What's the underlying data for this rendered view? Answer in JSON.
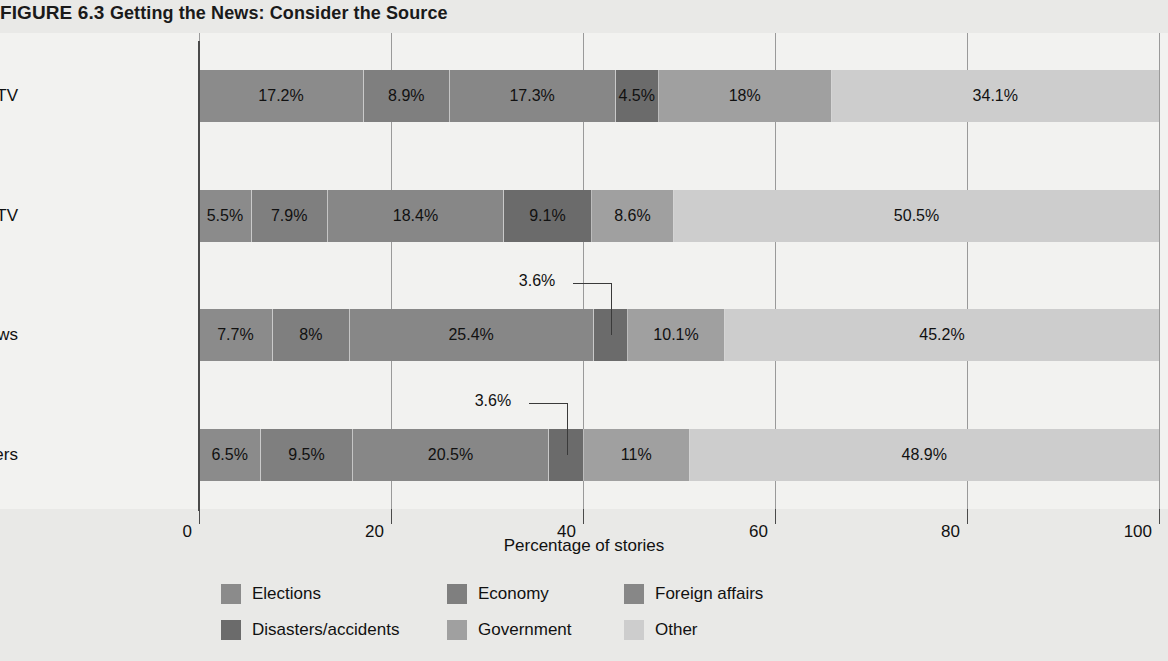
{
  "title": {
    "figure_number": "FIGURE 6.3",
    "figure_caption": "Getting the News: Consider the Source"
  },
  "axis": {
    "x_title": "Percentage of stories",
    "x_ticks": [
      "0",
      "20",
      "40",
      "60",
      "80",
      "100"
    ],
    "x_tick_values": [
      0,
      20,
      40,
      60,
      80,
      100
    ],
    "x_min": 0,
    "x_max": 100
  },
  "legend": {
    "items": [
      {
        "label": "Elections",
        "color": "#8b8b8b"
      },
      {
        "label": "Economy",
        "color": "#7f7f7f"
      },
      {
        "label": "Foreign affairs",
        "color": "#878787"
      },
      {
        "label": "Disasters/accidents",
        "color": "#6b6b6b"
      },
      {
        "label": "Government",
        "color": "#a0a0a0"
      },
      {
        "label": "Other",
        "color": "#cdcdcd"
      }
    ]
  },
  "callouts": [
    {
      "row": "Online news",
      "label": "3.6%",
      "category": "Disasters/accidents"
    },
    {
      "row": "Newspapers",
      "label": "3.6%",
      "category": "Disasters/accidents"
    }
  ],
  "chart_data": {
    "type": "bar",
    "orientation": "horizontal",
    "stacked": true,
    "title": "FIGURE 6.3 Getting the News: Consider the Source",
    "xlabel": "Percentage of stories",
    "ylabel": "",
    "xlim": [
      0,
      100
    ],
    "grid": true,
    "legend_position": "bottom",
    "categories": [
      "Cable TV",
      "Network TV",
      "Online news",
      "Newspapers"
    ],
    "series": [
      {
        "name": "Elections",
        "color": "#8b8b8b",
        "values": [
          17.2,
          5.5,
          7.7,
          6.5
        ],
        "labels": [
          "17.2%",
          "5.5%",
          "7.7%",
          "6.5%"
        ]
      },
      {
        "name": "Economy",
        "color": "#7f7f7f",
        "values": [
          8.9,
          7.9,
          8.0,
          9.5
        ],
        "labels": [
          "8.9%",
          "7.9%",
          "8%",
          "9.5%"
        ]
      },
      {
        "name": "Foreign affairs",
        "color": "#878787",
        "values": [
          17.3,
          18.4,
          25.4,
          20.5
        ],
        "labels": [
          "17.3%",
          "18.4%",
          "25.4%",
          "20.5%"
        ]
      },
      {
        "name": "Disasters/accidents",
        "color": "#6b6b6b",
        "values": [
          4.5,
          9.1,
          3.6,
          3.6
        ],
        "labels": [
          "4.5%",
          "9.1%",
          "3.6%",
          "3.6%"
        ]
      },
      {
        "name": "Government",
        "color": "#a0a0a0",
        "values": [
          18.0,
          8.6,
          10.1,
          11.0
        ],
        "labels": [
          "18%",
          "8.6%",
          "10.1%",
          "11%"
        ]
      },
      {
        "name": "Other",
        "color": "#cdcdcd",
        "values": [
          34.1,
          50.5,
          45.2,
          48.9
        ],
        "labels": [
          "34.1%",
          "50.5%",
          "45.2%",
          "48.9%"
        ]
      }
    ]
  }
}
